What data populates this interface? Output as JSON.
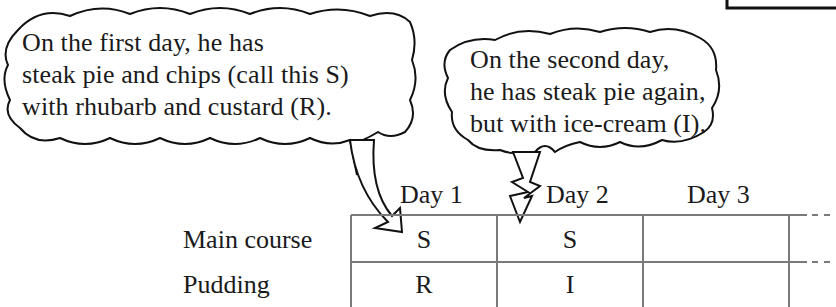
{
  "bubbles": [
    {
      "lines": [
        "On the first day, he has",
        "steak pie and chips (call this S)",
        "with rhubarb and custard (R)."
      ]
    },
    {
      "lines": [
        "On the second day,",
        "he has steak pie again,",
        "but with ice-cream (I)."
      ]
    }
  ],
  "table": {
    "columns": [
      "Day 1",
      "Day 2",
      "Day 3"
    ],
    "rows": [
      {
        "label": "Main course",
        "cells": [
          "S",
          "S",
          ""
        ]
      },
      {
        "label": "Pudding",
        "cells": [
          "R",
          "I",
          ""
        ]
      }
    ],
    "continues": true
  },
  "colors": {
    "ink": "#1a1a1a",
    "grid": "#7a7a7a"
  }
}
